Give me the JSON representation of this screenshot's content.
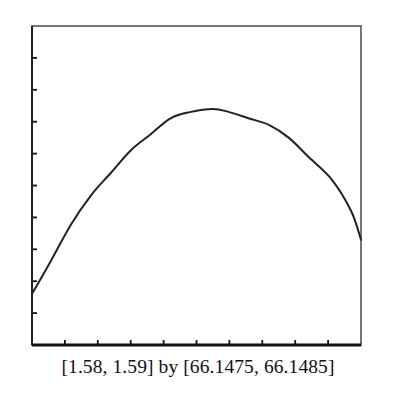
{
  "chart_data": {
    "type": "line",
    "title": "",
    "xlabel": "",
    "ylabel": "",
    "caption": "[1.58, 1.59] by [66.1475, 66.1485]",
    "xlim": [
      1.58,
      1.59
    ],
    "ylim": [
      66.1475,
      66.1485
    ],
    "x_tick_step": 0.001,
    "y_tick_step": 0.0001,
    "x_tick_count": 10,
    "y_tick_count": 10,
    "tick_labels_shown": false,
    "grid": false,
    "legend": null,
    "series": [
      {
        "name": "curve",
        "x": [
          1.58,
          1.5805,
          1.5812,
          1.5818,
          1.5824,
          1.583,
          1.5836,
          1.5842,
          1.5848,
          1.5855,
          1.586,
          1.5866,
          1.5872,
          1.5878,
          1.5884,
          1.5891,
          1.5897,
          1.59
        ],
        "y": [
          66.14766,
          66.14775,
          66.14788,
          66.14797,
          66.14804,
          66.14811,
          66.14816,
          66.14821,
          66.14823,
          66.14824,
          66.14823,
          66.14821,
          66.14819,
          66.14815,
          66.14809,
          66.14802,
          66.14792,
          66.14783
        ]
      }
    ],
    "annotations": [
      {
        "type": "maximum",
        "x": 1.5855,
        "y": 66.14824
      }
    ]
  },
  "frame": {
    "left_px": 32,
    "top_px": 26,
    "right_px": 361,
    "bottom_px": 345
  },
  "colors": {
    "frame": "#555555",
    "axis": "#111111",
    "curve": "#222222",
    "text": "#111111"
  }
}
